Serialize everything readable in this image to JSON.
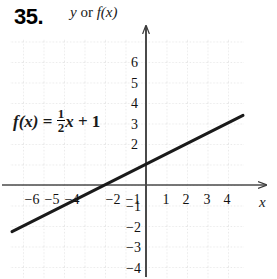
{
  "problem": {
    "number": "35."
  },
  "axis_title": {
    "y_part": "y",
    "conjunction": " or ",
    "f_part": "f(x)"
  },
  "equation": {
    "lhs": "f(x)",
    "equals": " = ",
    "fraction_numerator": "1",
    "fraction_denominator": "2",
    "variable": "x",
    "plus": " + ",
    "constant": "1",
    "full_text": "f(x) = 1/2 x + 1"
  },
  "axis_letters": {
    "x": "x"
  },
  "chart_data": {
    "type": "line",
    "title": "y or f(x)",
    "xlabel": "x",
    "ylabel": "y or f(x)",
    "annotations": [
      "f(x) = 1/2x + 1"
    ],
    "grid": true,
    "xlim": [
      -6.6,
      4.75
    ],
    "ylim": [
      -4.6,
      7.05
    ],
    "xticks": [
      -6,
      -5,
      -4,
      -2,
      -1,
      1,
      2,
      3,
      4
    ],
    "xtick_labels": [
      "−6",
      "−5",
      "−4",
      "−2",
      "−1",
      "1",
      "2",
      "3",
      "4"
    ],
    "yticks": [
      6,
      5,
      4,
      3,
      2,
      -1,
      -2,
      -3,
      -4
    ],
    "ytick_labels": [
      "6",
      "5",
      "4",
      "3",
      "2",
      "−1",
      "−2",
      "−3",
      "−4"
    ],
    "series": [
      {
        "name": "f(x) = 1/2x + 1",
        "equation": "y = 0.5x + 1",
        "slope": 0.5,
        "intercept": 1,
        "x": [
          -6.55,
          4.75
        ],
        "values": [
          -2.275,
          3.375
        ]
      }
    ]
  },
  "ticks": {
    "x": [
      {
        "label": "−6",
        "left": 32,
        "top": 192
      },
      {
        "label": "−5",
        "left": 52,
        "top": 192
      },
      {
        "label": "−4",
        "left": 72,
        "top": 192
      },
      {
        "label": "−2",
        "left": 113,
        "top": 192
      },
      {
        "label": "−1",
        "left": 133,
        "top": 192
      },
      {
        "label": "1",
        "left": 166,
        "top": 192
      },
      {
        "label": "2",
        "left": 186,
        "top": 192
      },
      {
        "label": "3",
        "left": 207,
        "top": 192
      },
      {
        "label": "4",
        "left": 227,
        "top": 192
      }
    ],
    "y": [
      {
        "label": "6",
        "left": 131,
        "top": 63
      },
      {
        "label": "5",
        "left": 131,
        "top": 84
      },
      {
        "label": "4",
        "left": 131,
        "top": 104
      },
      {
        "label": "3",
        "left": 131,
        "top": 125
      },
      {
        "label": "2",
        "left": 131,
        "top": 145
      },
      {
        "label": "−1",
        "left": 126,
        "top": 207
      },
      {
        "label": "−2",
        "left": 126,
        "top": 228
      },
      {
        "label": "−3",
        "left": 126,
        "top": 248
      },
      {
        "label": "−4",
        "left": 126,
        "top": 269
      }
    ]
  },
  "colors": {
    "background": "#ffffff",
    "grid": "#cfcfcf",
    "axis": "#4a4a4a",
    "line": "#1a1a1a",
    "text": "#111111"
  }
}
